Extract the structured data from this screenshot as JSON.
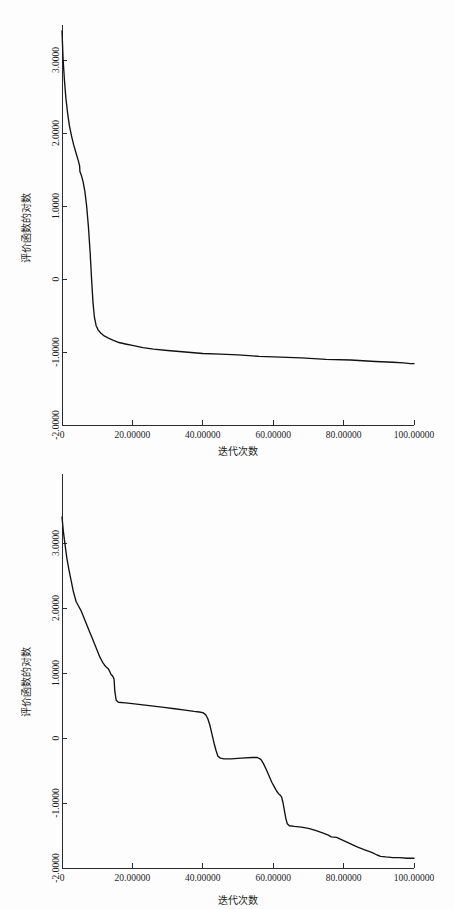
{
  "page": {
    "background_color": "#fdfdfd",
    "ink_color": "#111111",
    "figure_count": 2
  },
  "chart_data": [
    {
      "id": "figure-1",
      "type": "line",
      "title": "",
      "subtitle": "",
      "xlabel": "迭代次数",
      "ylabel": "评价函数的对数",
      "xlim": [
        0,
        100
      ],
      "ylim": [
        -2.0,
        3.4
      ],
      "grid": false,
      "legend": null,
      "legend_position": "none",
      "xticks": [
        0,
        20,
        40,
        60,
        80,
        100
      ],
      "xticklabels": [
        "0",
        "20.00000",
        "40.00000",
        "60.00000",
        "80.00000",
        "100.00000"
      ],
      "yticks": [
        3.0,
        2.0,
        1.0,
        0,
        -1.0,
        -2.0
      ],
      "yticklabels": [
        "3.0000",
        "2.0000",
        "1.0000",
        "0",
        "-1.0000",
        "-2.0000"
      ],
      "annotations": [],
      "series": [
        {
          "name": "评价函数的对数",
          "color": "#111111",
          "x": [
            0.0,
            0.3,
            0.7,
            1.1,
            1.6,
            2.1,
            2.7,
            3.3,
            3.9,
            4.4,
            4.8,
            5.0,
            5.1,
            5.5,
            6.0,
            6.5,
            7.0,
            7.5,
            8.0,
            8.4,
            8.8,
            9.2,
            9.7,
            10.3,
            11.0,
            12.0,
            13.2,
            14.6,
            16.2,
            18.0,
            20.0,
            23.0,
            26.0,
            30.0,
            35.0,
            40.0,
            45.0,
            50.0,
            56.0,
            62.0,
            68.0,
            75.0,
            82.0,
            89.0,
            94.0,
            97.0,
            99.0,
            100.0
          ],
          "y": [
            3.4,
            3.02,
            2.72,
            2.48,
            2.27,
            2.1,
            1.96,
            1.84,
            1.74,
            1.66,
            1.59,
            1.55,
            1.47,
            1.42,
            1.33,
            1.2,
            1.0,
            0.72,
            0.36,
            0.0,
            -0.32,
            -0.52,
            -0.64,
            -0.7,
            -0.74,
            -0.78,
            -0.81,
            -0.84,
            -0.87,
            -0.89,
            -0.91,
            -0.94,
            -0.96,
            -0.98,
            -1.0,
            -1.02,
            -1.03,
            -1.04,
            -1.06,
            -1.07,
            -1.08,
            -1.1,
            -1.11,
            -1.13,
            -1.14,
            -1.15,
            -1.16,
            -1.16
          ]
        }
      ]
    },
    {
      "id": "figure-2",
      "type": "line",
      "title": "",
      "subtitle": "",
      "xlabel": "迭代次数",
      "ylabel": "评价函数的对数",
      "xlim": [
        0,
        100
      ],
      "ylim": [
        -2.0,
        3.4
      ],
      "grid": false,
      "legend": null,
      "legend_position": "none",
      "xticks": [
        0,
        20,
        40,
        60,
        80,
        100
      ],
      "xticklabels": [
        "0",
        "20.00000",
        "40.00000",
        "60.00000",
        "80.00000",
        "100.00000"
      ],
      "yticks": [
        3.0,
        2.0,
        1.0,
        0,
        -1.0,
        -2.0
      ],
      "yticklabels": [
        "3.0000",
        "2.0000",
        "1.0000",
        "0",
        "-1.0000",
        "-2.0000"
      ],
      "annotations": [],
      "series": [
        {
          "name": "评价函数的对数",
          "color": "#111111",
          "x": [
            0.0,
            0.4,
            0.9,
            1.4,
            2.0,
            2.6,
            3.2,
            4.0,
            4.8,
            5.4,
            6.0,
            6.6,
            7.2,
            7.8,
            8.4,
            9.0,
            9.6,
            10.2,
            10.8,
            11.2,
            11.6,
            12.0,
            12.4,
            12.8,
            13.2,
            13.6,
            14.0,
            14.3,
            14.6,
            14.8,
            15.0,
            15.4,
            16.0,
            18.0,
            20.0,
            23.0,
            26.0,
            29.0,
            32.0,
            35.0,
            37.5,
            39.0,
            40.0,
            40.8,
            41.4,
            42.0,
            42.6,
            43.2,
            43.8,
            44.3,
            45.0,
            46.0,
            48.0,
            51.0,
            54.0,
            55.5,
            56.5,
            57.2,
            58.0,
            58.8,
            59.6,
            60.4,
            61.0,
            61.6,
            62.0,
            62.4,
            62.8,
            63.2,
            63.6,
            64.0,
            64.6,
            66.0,
            68.0,
            70.0,
            72.0,
            74.0,
            75.5,
            76.5,
            78.0,
            80.0,
            82.0,
            84.0,
            86.0,
            88.0,
            89.5,
            90.5,
            92.0,
            94.0,
            96.0,
            98.0,
            100.0
          ],
          "y": [
            3.4,
            3.17,
            2.96,
            2.76,
            2.58,
            2.42,
            2.26,
            2.1,
            2.02,
            1.96,
            1.88,
            1.8,
            1.72,
            1.64,
            1.56,
            1.48,
            1.4,
            1.32,
            1.24,
            1.2,
            1.16,
            1.13,
            1.1,
            1.08,
            1.06,
            1.02,
            0.97,
            0.96,
            0.93,
            0.9,
            0.72,
            0.58,
            0.55,
            0.54,
            0.53,
            0.51,
            0.49,
            0.47,
            0.45,
            0.43,
            0.41,
            0.4,
            0.39,
            0.36,
            0.3,
            0.2,
            0.06,
            -0.08,
            -0.2,
            -0.28,
            -0.31,
            -0.32,
            -0.32,
            -0.31,
            -0.3,
            -0.3,
            -0.33,
            -0.39,
            -0.48,
            -0.58,
            -0.68,
            -0.76,
            -0.82,
            -0.86,
            -0.88,
            -0.91,
            -1.0,
            -1.12,
            -1.24,
            -1.32,
            -1.35,
            -1.36,
            -1.37,
            -1.39,
            -1.42,
            -1.46,
            -1.49,
            -1.52,
            -1.53,
            -1.58,
            -1.63,
            -1.68,
            -1.72,
            -1.76,
            -1.8,
            -1.82,
            -1.83,
            -1.84,
            -1.84,
            -1.85,
            -1.85
          ]
        }
      ]
    }
  ]
}
